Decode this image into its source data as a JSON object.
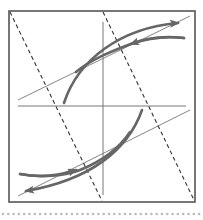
{
  "diagram": {
    "kind": "hysteresis-loop-construction",
    "colors": {
      "frame": "#555555",
      "axes": "#777777",
      "thin_lines": "#777777",
      "dashed_lines": "#333333",
      "curves": "#666666",
      "dots": "#bbbbbb",
      "background": "#ffffff"
    },
    "frame": {
      "x": 9,
      "y": 11,
      "w": 186,
      "h": 191
    },
    "axes": {
      "horizontal": {
        "x1": 18,
        "y1": 106,
        "x2": 186,
        "y2": 106
      },
      "vertical": {
        "x1": 103,
        "y1": 22,
        "x2": 103,
        "y2": 195
      }
    },
    "thin_lines": [
      {
        "x1": 18,
        "y1": 100,
        "x2": 190,
        "y2": 16
      },
      {
        "x1": 18,
        "y1": 196,
        "x2": 190,
        "y2": 110
      }
    ],
    "dashed_lines": [
      {
        "x1": 10,
        "y1": 12,
        "x2": 102,
        "y2": 201
      },
      {
        "x1": 103,
        "y1": 12,
        "x2": 194,
        "y2": 200
      }
    ],
    "curves": [
      {
        "d": "M 64 103 C 78 60, 120 28, 178 23",
        "arrow_at": "end"
      },
      {
        "d": "M 184 38 C 160 35, 140 40, 128 45 C 110 52, 90 60, 76 72",
        "arrow_at": "none"
      },
      {
        "d": "M 184 38 C 165 36, 148 38, 131 44",
        "arrow_at": "end"
      },
      {
        "d": "M 142 110 C 128 150, 90 180, 26 191",
        "arrow_at": "end"
      },
      {
        "d": "M 20 174 C 40 178, 65 176, 80 170 C 100 162, 118 150, 130 132",
        "arrow_at": "none"
      },
      {
        "d": "M 20 174 C 40 178, 58 176, 76 170",
        "arrow_at": "end"
      }
    ],
    "dots": {
      "y": 214,
      "x_start": 3,
      "x_end": 200,
      "spacing": 5.3,
      "r": 1.3
    }
  }
}
